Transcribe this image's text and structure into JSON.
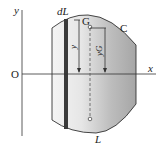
{
  "diagram": {
    "title": "",
    "axes": {
      "origin_label": "O",
      "x_label": "x",
      "y_label": "y"
    },
    "labels": {
      "strip": "dL",
      "centroid": "G",
      "curve": "C",
      "y_distance": "y",
      "yG_distance": "yG",
      "axis_of_rotation": "L"
    },
    "colors": {
      "shape_fill_light": "#f2f2f2",
      "shape_fill_dark": "#9a9a9a",
      "strip": "#3a3a3a",
      "line": "#333333"
    }
  }
}
